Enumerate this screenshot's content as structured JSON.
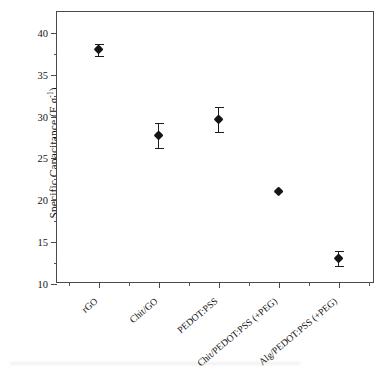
{
  "chart_data": {
    "type": "scatter",
    "title": "",
    "xlabel": "",
    "ylabel": "Specific Capacitance (F g",
    "ylabel_sup": "-1",
    "ylabel_tail": ")",
    "ylabel_full": "Specific Capacitance (F g-1)",
    "categories": [
      "rGO",
      "Chit/GO",
      "PEDOT:PSS",
      "Chit/PEDOT:PSS (+PEG)",
      "Alg/PEDOT:PSS (+PEG)"
    ],
    "values": [
      38.0,
      27.7,
      29.7,
      21.1,
      13.0
    ],
    "errors": [
      0.7,
      1.5,
      1.5,
      0.15,
      0.9
    ],
    "ylim": [
      10,
      42.5
    ],
    "xlim": [
      0.3,
      5.6
    ],
    "yticks": [
      10,
      15,
      20,
      25,
      30,
      35,
      40
    ],
    "ytick_labels": [
      "10",
      "15",
      "20",
      "25",
      "30",
      "35",
      "40"
    ],
    "yminor_step": 2.5,
    "grid": false,
    "legend": false,
    "marker": "filled-diamond",
    "marker_color": "#151515",
    "errorbar_color": "#1c1c1c",
    "frame_color": "#4a4a4a",
    "background": "#ffffff"
  }
}
